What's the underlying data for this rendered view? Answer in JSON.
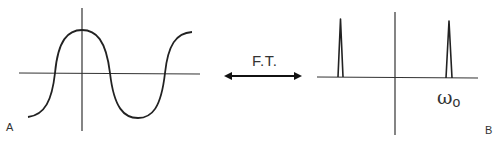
{
  "diagram": {
    "title": "",
    "panels": [
      {
        "id": "A",
        "label": "A",
        "description": "time-domain cosine wave"
      },
      {
        "id": "B",
        "label": "B",
        "description": "frequency-domain spectrum with two impulses at ±ω0"
      }
    ],
    "transform": {
      "label": "F.T.",
      "direction": "bidirectional"
    },
    "frequency_label": {
      "symbol": "ω",
      "subscript": "o"
    },
    "colors": {
      "stroke": "#222222",
      "axis": "#333333",
      "text": "#333333",
      "background": "#ffffff"
    }
  }
}
